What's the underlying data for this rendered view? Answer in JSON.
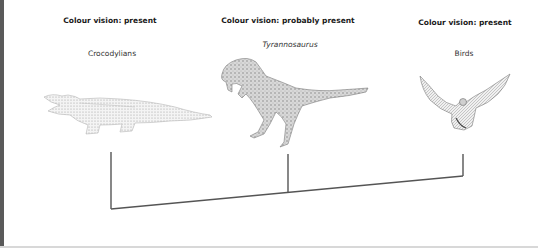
{
  "taxa": [
    {
      "name": "Crocodylians",
      "vision": "Colour vision: present",
      "italic": false
    },
    {
      "name": "Tyrannosaurus",
      "vision": "Colour vision: probably present",
      "italic": true
    },
    {
      "name": "Birds",
      "vision": "Colour vision: present",
      "italic": false
    }
  ],
  "colors": {
    "line": "#555555",
    "border": "#5a5a5a",
    "drawing": "#9a9a9a"
  }
}
